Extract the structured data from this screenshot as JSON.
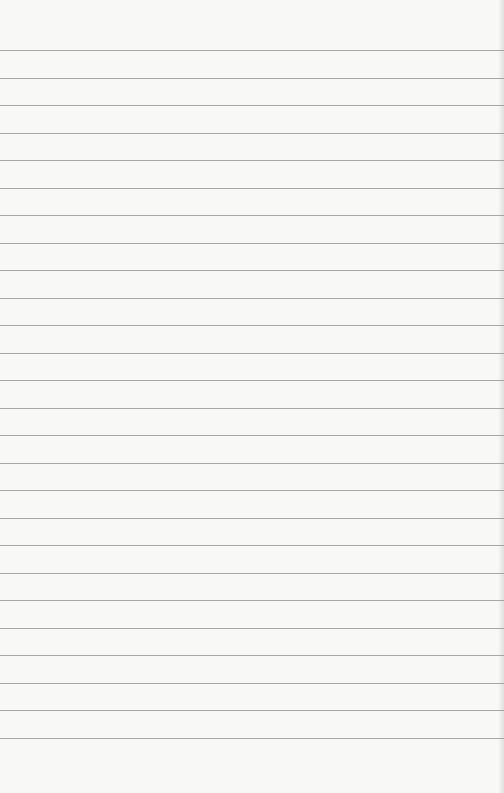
{
  "page": {
    "type": "lined-paper",
    "background_color": "#f8f8f7",
    "rule_color": "#9a9a9a",
    "rule_count": 26,
    "first_rule_y": 50,
    "rule_spacing": 27.5
  }
}
